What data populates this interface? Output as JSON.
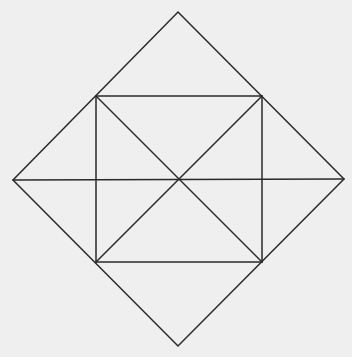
{
  "diagram": {
    "background": "#efefef",
    "stroke": "#2a2a2a",
    "points": {
      "top": [
        178,
        12
      ],
      "right": [
        344,
        179
      ],
      "bottom": [
        178,
        346
      ],
      "left": [
        13,
        180
      ],
      "rect_tl": [
        96,
        96
      ],
      "rect_tr": [
        262,
        96
      ],
      "rect_br": [
        262,
        262
      ],
      "rect_bl": [
        96,
        262
      ],
      "center": [
        178,
        179
      ]
    }
  }
}
